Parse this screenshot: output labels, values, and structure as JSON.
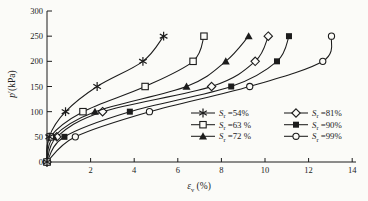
{
  "figure": {
    "kind": "scientific-line-chart"
  },
  "colors": {
    "ink": "#1c1c1c",
    "background": "#fbfbf8",
    "legend_background": "#fbfbf8"
  },
  "chart_data": {
    "type": "line",
    "title": "",
    "xlabel": {
      "italic": "ε",
      "sub": "v",
      "rest": " (%)"
    },
    "ylabel": {
      "italic": "p",
      "rest": "′(kPa)"
    },
    "xlim": [
      0,
      14
    ],
    "ylim": [
      0,
      300
    ],
    "x_ticks": [
      2,
      4,
      6,
      8,
      10,
      12,
      14
    ],
    "y_ticks": [
      0,
      50,
      100,
      150,
      200,
      250,
      300
    ],
    "grid": false,
    "legend_position": "inside-bottom-right",
    "pressure_levels_kpa": [
      0,
      50,
      100,
      150,
      200,
      250
    ],
    "series": [
      {
        "name": "Sr=54%",
        "marker": "star",
        "legend": {
          "sym": "S",
          "sub": "r",
          "val": " =54%"
        },
        "legend_col": 0,
        "points": [
          [
            0,
            0
          ],
          [
            0.1,
            50
          ],
          [
            0.85,
            100
          ],
          [
            2.3,
            150
          ],
          [
            4.4,
            200
          ],
          [
            5.35,
            250
          ]
        ]
      },
      {
        "name": "Sr=63%",
        "marker": "open-square",
        "legend": {
          "sym": "S",
          "sub": "r",
          "val": " =63 %"
        },
        "legend_col": 0,
        "points": [
          [
            0,
            0
          ],
          [
            0.15,
            50
          ],
          [
            1.65,
            100
          ],
          [
            4.5,
            150
          ],
          [
            6.7,
            200
          ],
          [
            7.2,
            250
          ]
        ]
      },
      {
        "name": "Sr=72%",
        "marker": "filled-triangle",
        "legend": {
          "sym": "S",
          "sub": "r",
          "val": " =72 %"
        },
        "legend_col": 0,
        "points": [
          [
            0,
            0
          ],
          [
            0.3,
            50
          ],
          [
            2.2,
            100
          ],
          [
            6.4,
            150
          ],
          [
            8.2,
            200
          ],
          [
            9.25,
            250
          ]
        ]
      },
      {
        "name": "Sr=81%",
        "marker": "open-diamond",
        "legend": {
          "sym": "S",
          "sub": "r",
          "val": " =81%"
        },
        "legend_col": 1,
        "points": [
          [
            0,
            0
          ],
          [
            0.45,
            50
          ],
          [
            2.55,
            100
          ],
          [
            7.55,
            150
          ],
          [
            9.55,
            200
          ],
          [
            10.15,
            250
          ]
        ]
      },
      {
        "name": "Sr=90%",
        "marker": "filled-square",
        "legend": {
          "sym": "S",
          "sub": "r",
          "val": " =90%"
        },
        "legend_col": 1,
        "points": [
          [
            0,
            0
          ],
          [
            0.8,
            50
          ],
          [
            3.8,
            100
          ],
          [
            8.45,
            150
          ],
          [
            10.55,
            200
          ],
          [
            11.1,
            250
          ]
        ]
      },
      {
        "name": "Sr=99%",
        "marker": "open-circle",
        "legend": {
          "sym": "S",
          "sub": "r",
          "val": " =99%"
        },
        "legend_col": 1,
        "points": [
          [
            0,
            0
          ],
          [
            1.3,
            50
          ],
          [
            4.7,
            100
          ],
          [
            9.3,
            150
          ],
          [
            12.65,
            200
          ],
          [
            13.05,
            250
          ]
        ]
      }
    ]
  }
}
